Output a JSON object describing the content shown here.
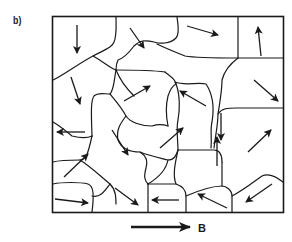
{
  "figure": {
    "panel_label": "b)",
    "field_label": "B",
    "colors": {
      "ink": "#1a1a1a",
      "background": "#ffffff"
    }
  },
  "domains": [
    {
      "id": 1,
      "arrow": "down"
    },
    {
      "id": 2,
      "arrow": "down-right"
    },
    {
      "id": 3,
      "arrow": "right"
    },
    {
      "id": 4,
      "arrow": "up"
    },
    {
      "id": 5,
      "arrow": "down"
    },
    {
      "id": 6,
      "arrow": "up-right"
    },
    {
      "id": 7,
      "arrow": "down"
    },
    {
      "id": 8,
      "arrow": "up-left"
    },
    {
      "id": 9,
      "arrow": "down-right"
    },
    {
      "id": 10,
      "arrow": "left"
    },
    {
      "id": 11,
      "arrow": "down-right"
    },
    {
      "id": 12,
      "arrow": "up-right"
    },
    {
      "id": 13,
      "arrow": "up"
    },
    {
      "id": 14,
      "arrow": "up-right"
    },
    {
      "id": 15,
      "arrow": "up-right"
    },
    {
      "id": 16,
      "arrow": "right"
    },
    {
      "id": 17,
      "arrow": "down-right"
    },
    {
      "id": 18,
      "arrow": "left"
    },
    {
      "id": 19,
      "arrow": "up-left"
    },
    {
      "id": 20,
      "arrow": "down-left"
    }
  ]
}
